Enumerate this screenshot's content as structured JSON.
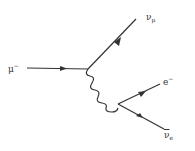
{
  "diagram": {
    "particles": {
      "incoming_muon": {
        "symbol": "μ",
        "superscript": "−"
      },
      "muon_neutrino": {
        "symbol": "ν",
        "subscript": "μ"
      },
      "electron": {
        "symbol": "e",
        "superscript": "−"
      },
      "electron_antineutrino": {
        "symbol": "ν",
        "subscript": "e",
        "bar": true
      }
    },
    "propagator": "W boson (wavy line)",
    "line_color": "#333333"
  }
}
